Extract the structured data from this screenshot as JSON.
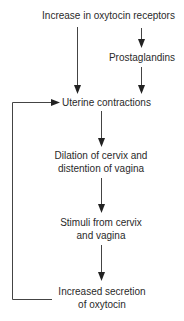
{
  "diagram": {
    "type": "flowchart",
    "nodes": [
      {
        "id": "receptors",
        "lines": [
          "Increase in oxytocin receptors"
        ]
      },
      {
        "id": "prostaglandins",
        "lines": [
          "Prostaglandins"
        ]
      },
      {
        "id": "contractions",
        "lines": [
          "Uterine contractions"
        ]
      },
      {
        "id": "dilation",
        "lines": [
          "Dilation of cervix and",
          "distention of vagina"
        ]
      },
      {
        "id": "stimuli",
        "lines": [
          "Stimuli from cervix",
          "and vagina"
        ]
      },
      {
        "id": "secretion",
        "lines": [
          "Increased secretion",
          "of oxytocin"
        ]
      }
    ],
    "edges": [
      {
        "from": "receptors",
        "to": "contractions"
      },
      {
        "from": "receptors",
        "to": "prostaglandins"
      },
      {
        "from": "prostaglandins",
        "to": "contractions"
      },
      {
        "from": "contractions",
        "to": "dilation"
      },
      {
        "from": "dilation",
        "to": "stimuli"
      },
      {
        "from": "stimuli",
        "to": "secretion"
      },
      {
        "from": "secretion",
        "to": "contractions",
        "kind": "feedback-loop"
      }
    ],
    "colors": {
      "line": "#333333",
      "text": "#2a2a2a",
      "background": "#ffffff"
    }
  }
}
